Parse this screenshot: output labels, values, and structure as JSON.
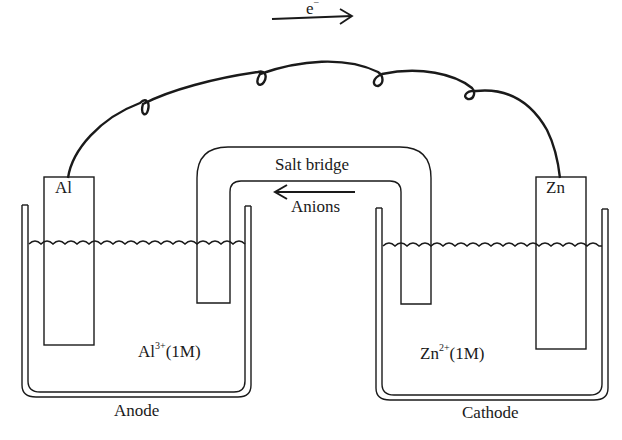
{
  "diagram": {
    "electron_flow": {
      "label": "e",
      "superscript": "−",
      "direction": "right"
    },
    "wire": {
      "coils": 4
    },
    "salt_bridge": {
      "label": "Salt bridge",
      "ion_flow_label": "Anions",
      "ion_flow_direction": "left"
    },
    "left_cell": {
      "electrode": "Al",
      "solution_base": "Al",
      "solution_charge": "3+",
      "solution_conc": "(1M)",
      "role": "Anode"
    },
    "right_cell": {
      "electrode": "Zn",
      "solution_base": "Zn",
      "solution_charge": "2+",
      "solution_conc": "(1M)",
      "role": "Cathode"
    },
    "colors": {
      "ink": "#1a1a1a",
      "background": "#ffffff"
    }
  }
}
